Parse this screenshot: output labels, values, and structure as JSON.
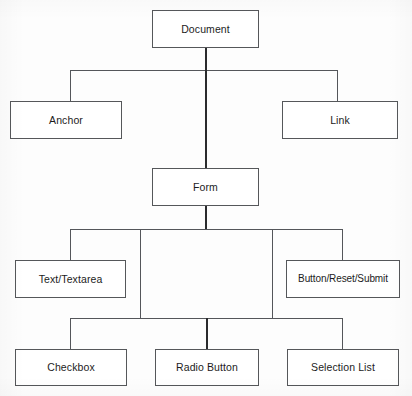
{
  "diagram": {
    "type": "tree",
    "background_color": "#fdfdfd",
    "line_color": "#54565a",
    "text_color": "#1c1c1c",
    "nodes": [
      {
        "id": "document",
        "label": "Document",
        "level": 0,
        "x": 152,
        "y": 10,
        "w": 107,
        "h": 38
      },
      {
        "id": "anchor",
        "label": "Anchor",
        "level": 1,
        "x": 10,
        "y": 101,
        "w": 112,
        "h": 38
      },
      {
        "id": "link",
        "label": "Link",
        "level": 1,
        "x": 282,
        "y": 101,
        "w": 116,
        "h": 38
      },
      {
        "id": "form",
        "label": "Form",
        "level": 1,
        "x": 152,
        "y": 168,
        "w": 107,
        "h": 38
      },
      {
        "id": "text_textarea",
        "label": "Text/Textarea",
        "level": 2,
        "x": 15,
        "y": 260,
        "w": 111,
        "h": 38
      },
      {
        "id": "button_group",
        "label": "Button/Reset/Submit",
        "level": 2,
        "x": 286,
        "y": 260,
        "w": 114,
        "h": 38
      },
      {
        "id": "checkbox",
        "label": "Checkbox",
        "level": 2,
        "x": 15,
        "y": 349,
        "w": 112,
        "h": 37
      },
      {
        "id": "radio_button",
        "label": "Radio Button",
        "level": 2,
        "x": 155,
        "y": 349,
        "w": 104,
        "h": 37
      },
      {
        "id": "selection_list",
        "label": "Selection List",
        "level": 2,
        "x": 287,
        "y": 349,
        "w": 112,
        "h": 37
      }
    ],
    "edges": [
      {
        "from": "document",
        "to": "anchor"
      },
      {
        "from": "document",
        "to": "link"
      },
      {
        "from": "document",
        "to": "form"
      },
      {
        "from": "form",
        "to": "text_textarea"
      },
      {
        "from": "form",
        "to": "button_group"
      },
      {
        "from": "form",
        "to": "checkbox"
      },
      {
        "from": "form",
        "to": "radio_button"
      },
      {
        "from": "form",
        "to": "selection_list"
      }
    ]
  }
}
